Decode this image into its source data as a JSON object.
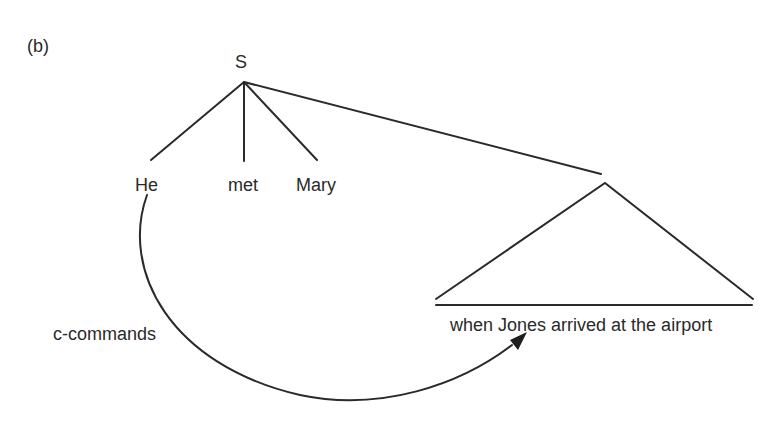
{
  "figure": {
    "panel_label": "(b)",
    "root_label": "S",
    "children": [
      "He",
      "met",
      "Mary"
    ],
    "subtree_text": "when Jones arrived at the airport",
    "arrow_label": "c-commands"
  },
  "colors": {
    "line": "#2a2a2a",
    "background": "#ffffff"
  }
}
